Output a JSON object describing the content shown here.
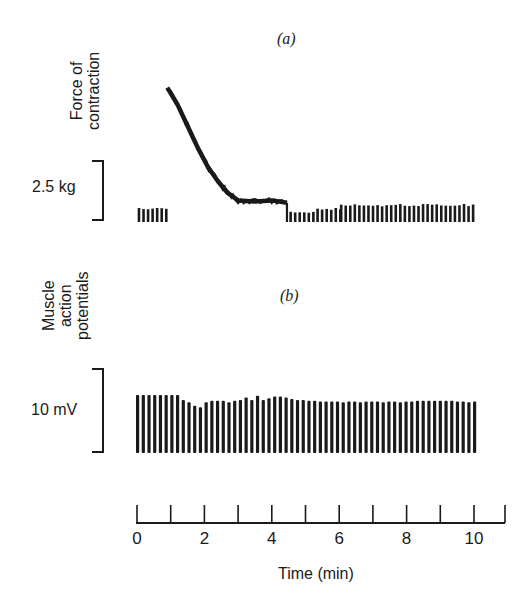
{
  "panels": {
    "a": {
      "label": "(a)",
      "ylabel_line1": "Force of",
      "ylabel_line2": "contraction",
      "scale_label": "2.5 kg"
    },
    "b": {
      "label": "(b)",
      "ylabel_line1": "Muscle",
      "ylabel_line2": "action",
      "ylabel_line3": "potentials",
      "scale_label": "10 mV"
    }
  },
  "axis": {
    "title": "Time (min)",
    "tick_labels": [
      "0",
      "2",
      "4",
      "6",
      "8",
      "10"
    ]
  },
  "chart_data": [
    {
      "type": "line",
      "title": "(a) Force of contraction",
      "xlabel": "Time (min)",
      "ylabel": "Force of contraction",
      "scale_bar": "2.5 kg",
      "xlim": [
        0,
        11
      ],
      "notes": "Twitch bars 0-0.9 min; tetanic contraction starts ~0.9 min at peak (~5.5 kg above baseline) decaying to ~1 kg by ~3 min, plateau until ~4.5 min; then twitches return reduced, recovering by ~6 min",
      "x": [
        0.9,
        1.2,
        1.5,
        1.8,
        2.1,
        2.4,
        2.7,
        3.0,
        3.5,
        4.0,
        4.45
      ],
      "values": [
        5.6,
        4.9,
        4.0,
        3.1,
        2.3,
        1.7,
        1.2,
        0.9,
        0.85,
        0.9,
        0.8
      ],
      "twitch_groups": [
        {
          "start": 0.0,
          "end": 0.9,
          "amplitude": 0.55
        },
        {
          "start": 4.5,
          "end": 5.3,
          "amplitude": 0.4
        },
        {
          "start": 5.3,
          "end": 6.0,
          "amplitude": 0.55
        },
        {
          "start": 6.0,
          "end": 10.0,
          "amplitude": 0.7
        }
      ]
    },
    {
      "type": "bar",
      "title": "(b) Muscle action potentials",
      "xlabel": "Time (min)",
      "ylabel": "Muscle action potentials",
      "scale_bar": "10 mV",
      "xlim": [
        0,
        11
      ],
      "ylim": [
        0,
        10
      ],
      "x_start": 0,
      "x_end": 10,
      "count": 60,
      "values": [
        7.0,
        7.0,
        7.0,
        7.0,
        7.0,
        7.0,
        7.0,
        7.0,
        6.4,
        6.1,
        5.7,
        5.5,
        6.1,
        6.3,
        6.3,
        6.3,
        6.1,
        6.3,
        6.4,
        6.7,
        6.4,
        6.9,
        6.4,
        6.6,
        6.8,
        6.8,
        6.7,
        6.5,
        6.4,
        6.4,
        6.3,
        6.3,
        6.2,
        6.2,
        6.2,
        6.2,
        6.1,
        6.2,
        6.2,
        6.1,
        6.2,
        6.2,
        6.2,
        6.1,
        6.2,
        6.2,
        6.1,
        6.2,
        6.2,
        6.3,
        6.3,
        6.3,
        6.3,
        6.3,
        6.3,
        6.3,
        6.2,
        6.2,
        6.1,
        6.2
      ]
    }
  ]
}
